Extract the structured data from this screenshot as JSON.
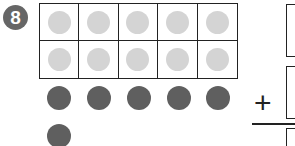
{
  "problem": {
    "number": "8",
    "operator": "+",
    "ten_frame": {
      "rows": 2,
      "columns": 5,
      "filled_counters": 10,
      "counter_color": "#d4d4d4"
    },
    "loose_counters": {
      "count": 6,
      "color": "#5f5f5f",
      "positions": [
        [
          47,
          94
        ],
        [
          87,
          94
        ],
        [
          127,
          94
        ],
        [
          167,
          94
        ],
        [
          206,
          94
        ],
        [
          47,
          132
        ]
      ]
    },
    "answer_boxes": [
      {
        "name": "addend-1-box",
        "value": ""
      },
      {
        "name": "addend-2-box",
        "value": ""
      },
      {
        "name": "sum-box",
        "value": ""
      }
    ]
  }
}
